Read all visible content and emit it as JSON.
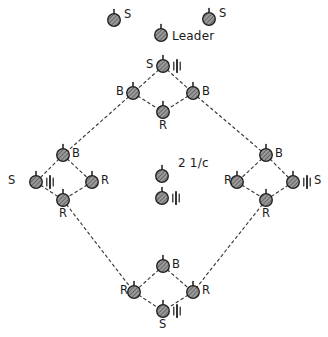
{
  "figure": {
    "title": "",
    "watermark": "",
    "background_color": "#ffffff",
    "node_fill": "#8d8d8d",
    "node_stroke": "#1c1c1c",
    "line_color": "#3a3a3a",
    "text_color": "#1b1b1b",
    "width": 328,
    "height": 337
  },
  "legend_note": {
    "text": "2 1/c",
    "x": 178,
    "y": 163
  },
  "nodes": [
    {
      "id": "s-top-left",
      "label": "S",
      "label_pos": "right",
      "x": 114,
      "y": 20,
      "tick": false,
      "lx": 124,
      "ly": 9
    },
    {
      "id": "s-top-right",
      "label": "S",
      "label_pos": "right",
      "x": 209,
      "y": 19,
      "tick": false,
      "lx": 219,
      "ly": 8
    },
    {
      "id": "leader",
      "label": "Leader",
      "label_pos": "right",
      "x": 161,
      "y": 35,
      "tick": false,
      "lx": 172,
      "ly": 30
    },
    {
      "id": "top-s",
      "label": "S",
      "label_pos": "left",
      "x": 163,
      "y": 66,
      "tick": true,
      "lx": 146,
      "ly": 59
    },
    {
      "id": "top-b-left",
      "label": "B",
      "label_pos": "left",
      "x": 133,
      "y": 93,
      "tick": false,
      "lx": 116,
      "ly": 86
    },
    {
      "id": "top-b-right",
      "label": "B",
      "label_pos": "right",
      "x": 193,
      "y": 93,
      "tick": false,
      "lx": 202,
      "ly": 86
    },
    {
      "id": "top-r",
      "label": "R",
      "label_pos": "below",
      "x": 163,
      "y": 112,
      "tick": false,
      "lx": 159,
      "ly": 120
    },
    {
      "id": "left-b",
      "label": "B",
      "label_pos": "right",
      "x": 63,
      "y": 155,
      "tick": false,
      "lx": 72,
      "ly": 148
    },
    {
      "id": "left-s",
      "label": "S",
      "label_pos": "left",
      "x": 36,
      "y": 182,
      "tick": true,
      "lx": 8,
      "ly": 175
    },
    {
      "id": "left-r-right",
      "label": "R",
      "label_pos": "right",
      "x": 92,
      "y": 182,
      "tick": false,
      "lx": 101,
      "ly": 175
    },
    {
      "id": "left-r-bottom",
      "label": "R",
      "label_pos": "below",
      "x": 63,
      "y": 200,
      "tick": false,
      "lx": 59,
      "ly": 208
    },
    {
      "id": "right-b",
      "label": "B",
      "label_pos": "right",
      "x": 266,
      "y": 155,
      "tick": false,
      "lx": 275,
      "ly": 148
    },
    {
      "id": "right-r-left",
      "label": "R",
      "label_pos": "left",
      "x": 237,
      "y": 182,
      "tick": false,
      "lx": 224,
      "ly": 175
    },
    {
      "id": "right-s",
      "label": "S",
      "label_pos": "right",
      "x": 293,
      "y": 182,
      "tick": true,
      "lx": 314,
      "ly": 175
    },
    {
      "id": "right-r-bottom",
      "label": "R",
      "label_pos": "below",
      "x": 266,
      "y": 200,
      "tick": false,
      "lx": 262,
      "ly": 208
    },
    {
      "id": "center-upper",
      "label": "",
      "label_pos": "none",
      "x": 162,
      "y": 176,
      "tick": false,
      "lx": 0,
      "ly": 0
    },
    {
      "id": "center-lower",
      "label": "",
      "label_pos": "none",
      "x": 162,
      "y": 198,
      "tick": true,
      "lx": 0,
      "ly": 0
    },
    {
      "id": "bot-b",
      "label": "B",
      "label_pos": "right",
      "x": 163,
      "y": 266,
      "tick": false,
      "lx": 172,
      "ly": 259
    },
    {
      "id": "bot-r-left",
      "label": "R",
      "label_pos": "left",
      "x": 134,
      "y": 292,
      "tick": false,
      "lx": 120,
      "ly": 285
    },
    {
      "id": "bot-r-right",
      "label": "R",
      "label_pos": "right",
      "x": 193,
      "y": 292,
      "tick": false,
      "lx": 202,
      "ly": 285
    },
    {
      "id": "bot-s",
      "label": "S",
      "label_pos": "below",
      "x": 163,
      "y": 311,
      "tick": true,
      "lx": 159,
      "ly": 319
    }
  ],
  "edges": [
    {
      "from": "top-s",
      "to": "top-b-left",
      "style": "dashed"
    },
    {
      "from": "top-s",
      "to": "top-b-right",
      "style": "dashed"
    },
    {
      "from": "top-b-left",
      "to": "top-r",
      "style": "dashed"
    },
    {
      "from": "top-b-right",
      "to": "top-r",
      "style": "dashed"
    },
    {
      "from": "left-b",
      "to": "left-s",
      "style": "dashed"
    },
    {
      "from": "left-b",
      "to": "left-r-right",
      "style": "dashed"
    },
    {
      "from": "left-s",
      "to": "left-r-bottom",
      "style": "dashed"
    },
    {
      "from": "left-r-right",
      "to": "left-r-bottom",
      "style": "dashed"
    },
    {
      "from": "right-b",
      "to": "right-r-left",
      "style": "dashed"
    },
    {
      "from": "right-b",
      "to": "right-s",
      "style": "dashed"
    },
    {
      "from": "right-r-left",
      "to": "right-r-bottom",
      "style": "dashed"
    },
    {
      "from": "right-s",
      "to": "right-r-bottom",
      "style": "dashed"
    },
    {
      "from": "bot-b",
      "to": "bot-r-left",
      "style": "dashed"
    },
    {
      "from": "bot-b",
      "to": "bot-r-right",
      "style": "dashed"
    },
    {
      "from": "bot-r-left",
      "to": "bot-s",
      "style": "dashed"
    },
    {
      "from": "bot-r-right",
      "to": "bot-s",
      "style": "dashed"
    },
    {
      "from": "top-b-left",
      "to": "left-b",
      "style": "dashed"
    },
    {
      "from": "top-b-right",
      "to": "right-b",
      "style": "dashed"
    },
    {
      "from": "left-r-bottom",
      "to": "bot-r-left",
      "style": "dashed"
    },
    {
      "from": "right-r-bottom",
      "to": "bot-r-right",
      "style": "dashed"
    }
  ]
}
